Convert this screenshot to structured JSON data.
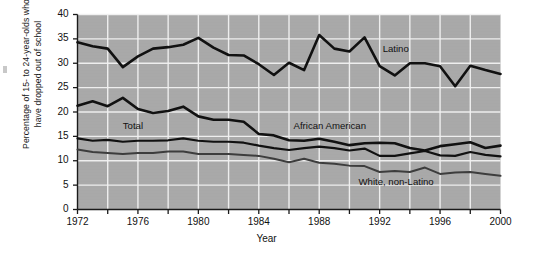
{
  "chart_data": {
    "type": "line",
    "title": "",
    "xlabel": "Year",
    "ylabel_line1": "Percentage of 15- to  24-year-olds who",
    "ylabel_line2": "have dropped out of school",
    "ylim": [
      0,
      40
    ],
    "xlim": [
      1972,
      2000
    ],
    "ytick_values": [
      0,
      5,
      10,
      15,
      20,
      25,
      30,
      35,
      40
    ],
    "ytick_labels": [
      "0",
      "5",
      "10",
      "15",
      "20",
      "25",
      "30",
      "35",
      "40"
    ],
    "xtick_labels": [
      "1972",
      "1976",
      "1980",
      "1984",
      "1988",
      "1992",
      "1996",
      "2000"
    ],
    "xtick_values": [
      1972,
      1976,
      1980,
      1984,
      1988,
      1992,
      1996,
      2000
    ],
    "x_minor_step": 2,
    "grid": "white gridlines on gray panel, horizontal every 5, vertical every 2 years",
    "legend_position": "inline labels on plot",
    "plot_background": "#a8a8a8",
    "gridline_color": "#f2f2f2",
    "x": [
      1972,
      1973,
      1974,
      1975,
      1976,
      1977,
      1978,
      1979,
      1980,
      1981,
      1982,
      1983,
      1984,
      1985,
      1986,
      1987,
      1988,
      1989,
      1990,
      1991,
      1992,
      1993,
      1994,
      1995,
      1996,
      1997,
      1998,
      1999,
      2000
    ],
    "series": [
      {
        "name": "Latino",
        "color": "#111111",
        "width": 2.6,
        "label_x": 1992.2,
        "label_y": 33.0,
        "values": [
          34.3,
          33.5,
          33.0,
          29.2,
          31.4,
          33.0,
          33.3,
          33.8,
          35.2,
          33.2,
          31.7,
          31.6,
          29.8,
          27.6,
          30.1,
          28.6,
          35.8,
          33.0,
          32.4,
          35.3,
          29.4,
          27.5,
          30.0,
          30.0,
          29.4,
          25.3,
          29.5,
          28.6,
          27.8
        ]
      },
      {
        "name": "African American",
        "color": "#111111",
        "width": 2.6,
        "label_x": 1986.3,
        "label_y": 17.1,
        "values": [
          21.3,
          22.2,
          21.2,
          22.9,
          20.6,
          19.8,
          20.2,
          21.1,
          19.1,
          18.4,
          18.4,
          18.0,
          15.5,
          15.2,
          14.2,
          14.1,
          14.5,
          13.9,
          13.2,
          13.6,
          13.7,
          13.6,
          12.6,
          12.1,
          13.0,
          13.4,
          13.8,
          12.6,
          13.1
        ]
      },
      {
        "name": "Total",
        "color": "#111111",
        "width": 2.2,
        "label_x": 1975.0,
        "label_y": 17.2,
        "values": [
          14.6,
          14.1,
          14.3,
          13.9,
          14.1,
          14.1,
          14.2,
          14.6,
          14.1,
          13.9,
          13.9,
          13.7,
          13.1,
          12.6,
          12.2,
          12.6,
          12.9,
          12.6,
          12.1,
          12.5,
          11.0,
          11.0,
          11.5,
          12.0,
          11.1,
          11.0,
          11.8,
          11.2,
          10.9
        ]
      },
      {
        "name": "White, non-Latino",
        "color": "#3d3d3d",
        "width": 2.0,
        "label_x": 1990.6,
        "label_y": 5.6,
        "values": [
          12.3,
          11.8,
          11.6,
          11.4,
          11.6,
          11.6,
          11.9,
          11.9,
          11.4,
          11.4,
          11.4,
          11.2,
          11.0,
          10.4,
          9.7,
          10.4,
          9.6,
          9.4,
          9.0,
          8.9,
          7.7,
          7.9,
          7.7,
          8.6,
          7.3,
          7.6,
          7.7,
          7.3,
          6.9
        ]
      }
    ]
  }
}
